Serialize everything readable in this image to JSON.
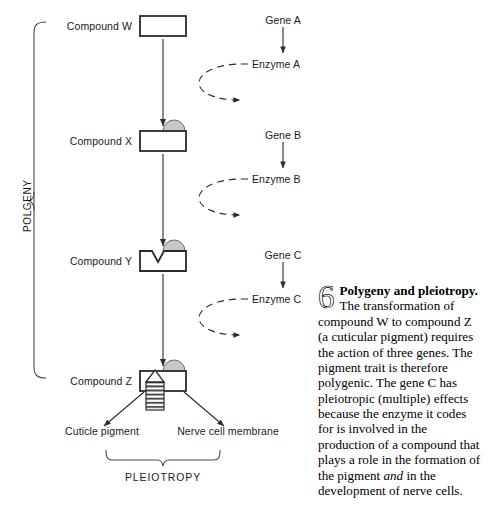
{
  "figure": {
    "number": "6",
    "lead": "Polygeny and pleiotropy.",
    "body_1": " The transformation of compound W to compound Z (a cuticular pigment) requires the action of three genes. The pigment trait is therefore polygenic. The gene C has pleiotropic (multiple) effects because the enzyme it codes for is involved in the production of a compound that plays a role in the formation of the pigment ",
    "body_italic": "and",
    "body_2": " in the development of nerve cells."
  },
  "brackets": {
    "polygeny_label": "POLGENY",
    "pleiotropy_label": "PLEIOTROPY"
  },
  "pathway": {
    "compounds": [
      {
        "label": "Compound W",
        "shape": "plain-box"
      },
      {
        "label": "Compound X",
        "shape": "box-with-dome"
      },
      {
        "label": "Compound Y",
        "shape": "box-with-dome-and-notch"
      },
      {
        "label": "Compound Z",
        "shape": "box-with-dome-and-column"
      }
    ]
  },
  "genes": [
    {
      "gene": "Gene A",
      "enzyme": "Enzyme A"
    },
    {
      "gene": "Gene B",
      "enzyme": "Enzyme B"
    },
    {
      "gene": "Gene C",
      "enzyme": "Enzyme C"
    }
  ],
  "outcomes": [
    {
      "label": "Cuticle pigment"
    },
    {
      "label": "Nerve cell membrane"
    }
  ],
  "colors": {
    "ink": "#1a1a1a",
    "stroke": "#2b2b2b",
    "dome_fill": "#c8c8c8",
    "background": "#ffffff"
  }
}
